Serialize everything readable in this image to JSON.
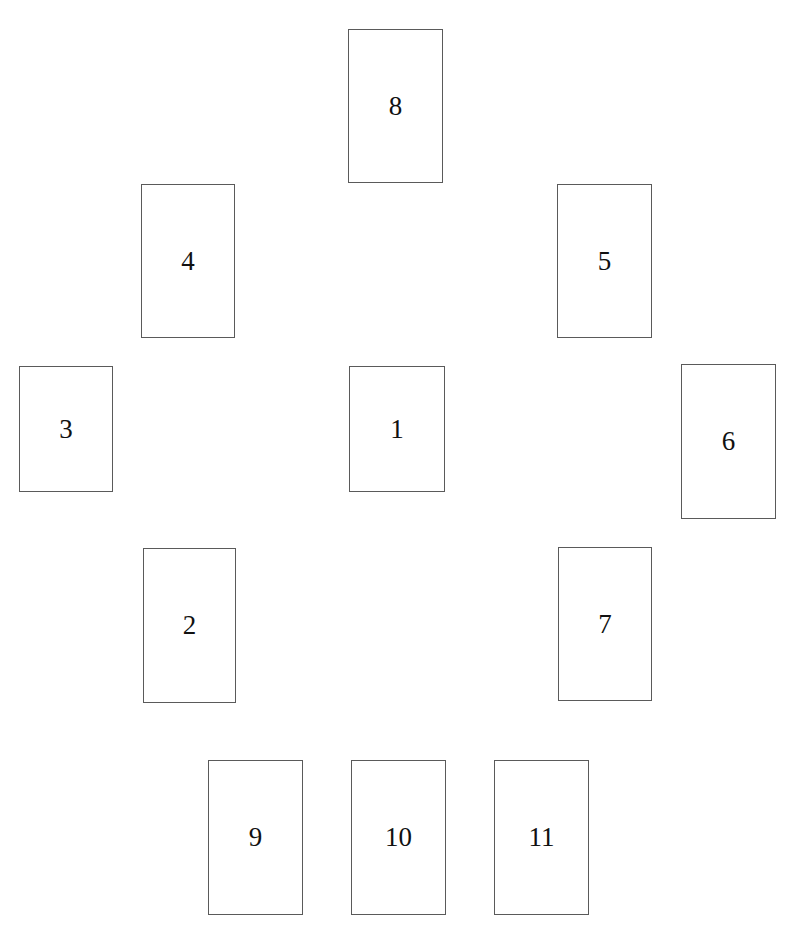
{
  "diagram": {
    "type": "card-spread",
    "border_color": "#5a5a5a",
    "text_color": "#111111",
    "background": "#ffffff",
    "cards": [
      {
        "label": "8",
        "x": 348,
        "y": 29,
        "w": 95,
        "h": 154
      },
      {
        "label": "4",
        "x": 141,
        "y": 184,
        "w": 94,
        "h": 154
      },
      {
        "label": "5",
        "x": 557,
        "y": 184,
        "w": 95,
        "h": 154
      },
      {
        "label": "3",
        "x": 19,
        "y": 366,
        "w": 94,
        "h": 126
      },
      {
        "label": "1",
        "x": 349,
        "y": 366,
        "w": 96,
        "h": 126
      },
      {
        "label": "6",
        "x": 681,
        "y": 364,
        "w": 95,
        "h": 155
      },
      {
        "label": "2",
        "x": 143,
        "y": 548,
        "w": 93,
        "h": 155
      },
      {
        "label": "7",
        "x": 558,
        "y": 547,
        "w": 94,
        "h": 154
      },
      {
        "label": "9",
        "x": 208,
        "y": 760,
        "w": 95,
        "h": 155
      },
      {
        "label": "10",
        "x": 351,
        "y": 760,
        "w": 95,
        "h": 155
      },
      {
        "label": "11",
        "x": 494,
        "y": 760,
        "w": 95,
        "h": 155
      }
    ]
  }
}
